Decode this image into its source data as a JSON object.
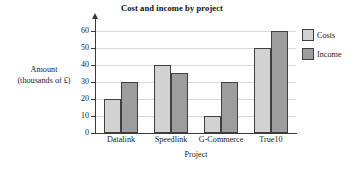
{
  "chart_data": {
    "type": "bar",
    "title": "Cost and income by project",
    "xlabel": "Project",
    "ylabel_line1": "Amount",
    "ylabel_line2": "(thousands of £)",
    "categories": [
      "Datalink",
      "Speedlink",
      "G-Commerce",
      "True10"
    ],
    "series": [
      {
        "name": "Costs",
        "color": "#d2d2d2",
        "values": [
          20,
          40,
          10,
          50
        ]
      },
      {
        "name": "Income",
        "color": "#9d9d9d",
        "values": [
          30,
          35,
          30,
          60
        ]
      }
    ],
    "ylim": [
      0,
      65
    ],
    "yticks": [
      0,
      10,
      20,
      30,
      40,
      50,
      60
    ],
    "ytick_labels": [
      "0",
      "10",
      "20",
      "30",
      "40",
      "50",
      "60"
    ],
    "grid": true,
    "legend_position": "right"
  },
  "legend": {
    "items": [
      {
        "label": "Costs",
        "swatch": "costs"
      },
      {
        "label": "Income",
        "swatch": "income"
      }
    ]
  }
}
